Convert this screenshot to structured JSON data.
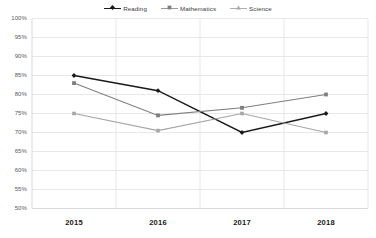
{
  "chart_data": {
    "type": "line",
    "title": "",
    "subtitle": "",
    "xlabel": "",
    "ylabel": "",
    "categories": [
      "2015",
      "2016",
      "2017",
      "2018"
    ],
    "x": [
      2015,
      2016,
      2017,
      2018
    ],
    "ylim": [
      50,
      100
    ],
    "ytick_labels": [
      "100%",
      "95%",
      "90%",
      "85%",
      "80%",
      "75%",
      "70%",
      "65%",
      "60%",
      "55%",
      "50%"
    ],
    "ytick_values": [
      100,
      95,
      90,
      85,
      80,
      75,
      70,
      65,
      60,
      55,
      50
    ],
    "ytick_step": 5,
    "grid": "horizontal-and-vertical",
    "legend_position": "top-center",
    "series": [
      {
        "name": "Reading",
        "values": [
          85,
          81,
          70,
          75
        ],
        "color": "#1a1a1a",
        "marker": "diamond"
      },
      {
        "name": "Mathematics",
        "values": [
          83,
          74.5,
          76.5,
          80
        ],
        "color": "#7f7f7f",
        "marker": "square"
      },
      {
        "name": "Science",
        "values": [
          75,
          70.5,
          75,
          70
        ],
        "color": "#a6a6a6",
        "marker": "triangle"
      }
    ]
  },
  "legend": {
    "items": [
      {
        "label": "Reading"
      },
      {
        "label": "Mathematics"
      },
      {
        "label": "Science"
      }
    ]
  },
  "colors": {
    "reading": "#1a1a1a",
    "mathematics": "#7f7f7f",
    "science": "#a6a6a6",
    "grid": "#e8e8e8",
    "axis": "#d9d9d9",
    "tick_text": "#595959",
    "category_text": "#1a1a1a",
    "background": "#ffffff"
  }
}
